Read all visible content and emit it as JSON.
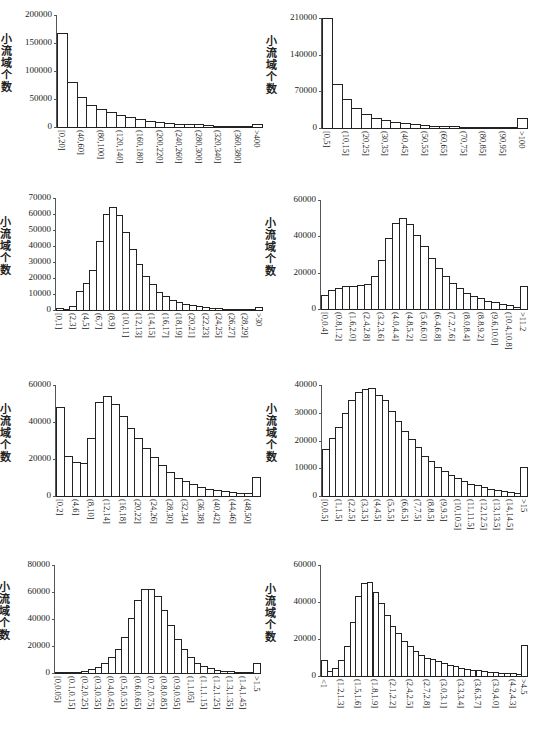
{
  "chart_data": [
    {
      "id": "c1",
      "type": "bar",
      "title": "",
      "xlabel": "小流域溪沟平均比降/‰",
      "ylabel": "小流域个数",
      "ylim": [
        0,
        200000
      ],
      "yticks": [
        0,
        50000,
        100000,
        150000,
        200000
      ],
      "categories": [
        "[0,20]",
        "(20,40]",
        "(40,60]",
        "(60,80]",
        "(80,100]",
        "(100,120]",
        "(120,140]",
        "(140,160]",
        "(160,180]",
        "(180,200]",
        "(200,220]",
        "(220,240]",
        "(240,260]",
        "(260,280]",
        "(280,300]",
        "(300,320]",
        "(320,340]",
        "(340,360]",
        "(360,380]",
        "(380,400]",
        ">400"
      ],
      "shown_tick_labels": [
        "[0,20]",
        "(40,60]",
        "(80,100]",
        "(120,140]",
        "(160,180]",
        "(200,220]",
        "(240,260]",
        "(280,300]",
        "(320,340]",
        "(360,380]",
        ">400"
      ],
      "values": [
        167000,
        80000,
        54000,
        39000,
        32000,
        26000,
        21000,
        17500,
        14000,
        11500,
        9500,
        7500,
        6000,
        5000,
        4500,
        3000,
        2500,
        1500,
        1000,
        800,
        5000
      ],
      "layout": {
        "left": 57,
        "right": 262,
        "top": 15,
        "base": 127
      }
    },
    {
      "id": "c2",
      "type": "bar",
      "title": "",
      "xlabel": "小流域河段比降/‰",
      "ylabel": "小流域个数",
      "ylim": [
        0,
        210000
      ],
      "yticks": [
        0,
        70000,
        140000,
        210000
      ],
      "categories": [
        "[0,5]",
        "(5,10]",
        "(10,15]",
        "(15,20]",
        "(20,25]",
        "(25,30]",
        "(30,35]",
        "(35,40]",
        "(40,45]",
        "(45,50]",
        "(50,55]",
        "(55,60]",
        "(60,65]",
        "(65,70]",
        "(70,75]",
        "(75,80]",
        "(80,85]",
        "(85,90]",
        "(90,95]",
        "(95,100]",
        ">100"
      ],
      "shown_tick_labels": [
        "[0,5]",
        "(10,15]",
        "(20,25]",
        "(30,35]",
        "(40,45]",
        "(50,55]",
        "(60,65]",
        "(70,75]",
        "(80,85]",
        "(90,95]",
        ">100"
      ],
      "values": [
        210000,
        84000,
        56000,
        38000,
        26000,
        19000,
        15000,
        11000,
        9000,
        7000,
        5500,
        4500,
        4000,
        3000,
        2500,
        2000,
        1500,
        1200,
        1000,
        1000,
        19000
      ],
      "layout": {
        "left": 322,
        "right": 527,
        "top": 18,
        "base": 128
      }
    },
    {
      "id": "c3",
      "type": "bar",
      "title": "",
      "xlabel": "小流域最长汇流路径长度/km",
      "ylabel": "小流域个数",
      "ylim": [
        0,
        70000
      ],
      "yticks": [
        0,
        10000,
        20000,
        30000,
        40000,
        50000,
        60000,
        70000
      ],
      "categories": [
        "[0,1]",
        "(1,2]",
        "(2,3]",
        "(3,4]",
        "(4,5]",
        "(5,6]",
        "(6,7]",
        "(7,8]",
        "(8,9]",
        "(9,10]",
        "(10,11]",
        "(11,12]",
        "(12,13]",
        "(13,14]",
        "(14,15]",
        "(15,16]",
        "(16,17]",
        "(17,18]",
        "(18,19]",
        "(19,20]",
        "(20,21]",
        "(21,22]",
        "(22,23]",
        "(23,24]",
        "(24,25]",
        "(25,26]",
        "(26,27]",
        "(27,28]",
        "(28,29]",
        "(29,30]",
        ">30"
      ],
      "shown_tick_labels": [
        "[0,1]",
        "(2,3]",
        "(4,5]",
        "(6,7]",
        "(8,9]",
        "(10,11]",
        "(12,13]",
        "(14,15]",
        "(16,17]",
        "(18,19]",
        "(20,21]",
        "(22,23]",
        "(24,25]",
        "(26,27]",
        "(28,29]",
        ">30"
      ],
      "values": [
        1500,
        500,
        2500,
        12000,
        17000,
        25000,
        43000,
        60000,
        64500,
        59500,
        49000,
        38000,
        28500,
        21000,
        16000,
        11500,
        8500,
        6500,
        5000,
        4000,
        3000,
        2200,
        1700,
        1300,
        1000,
        800,
        600,
        500,
        400,
        300,
        2000
      ],
      "layout": {
        "left": 56,
        "right": 262,
        "top": 198,
        "base": 310
      }
    },
    {
      "id": "c4",
      "type": "bar",
      "title": "",
      "xlabel": "小流域平均汇流路径长度/km",
      "ylabel": "小流域个数",
      "ylim": [
        0,
        60000
      ],
      "yticks": [
        0,
        20000,
        40000,
        60000
      ],
      "categories": [
        "[0,0.4]",
        "(0.4,0.8]",
        "(0.8,1.2]",
        "(1.2,1.6]",
        "(1.6,2.0]",
        "(2.0,2.4]",
        "(2.4,2.8]",
        "(2.8,3.2]",
        "(3.2,3.6]",
        "(3.6,4.0]",
        "(4.0,4.4]",
        "(4.4,4.8]",
        "(4.8,5.2]",
        "(5.2,5.6]",
        "(5.6,6.0]",
        "(6.0,6.4]",
        "(6.4,6.8]",
        "(6.8,7.2]",
        "(7.2,7.6]",
        "(7.6,8.0]",
        "(8.0,8.4]",
        "(8.4,8.8]",
        "(8.8,9.2]",
        "(9.2,9.6]",
        "(9.6,10.0]",
        "(10.0,10.4]",
        "(10.4,10.8]",
        "(10.8,11.2]",
        ">11.2"
      ],
      "shown_tick_labels": [
        "[0,0.4]",
        "(0.8,1.2]",
        "(1.6,2.0]",
        "(2.4,2.8]",
        "(3.2,3.6]",
        "(4.0,4.4]",
        "(4.8,5.2]",
        "(5.6,6.0]",
        "(6.4,6.8]",
        "(7.2,7.6]",
        "(8.0,8.4]",
        "(8.8,9.2]",
        "(9.6,10.0]",
        "(10.4,10.8]",
        ">11.2"
      ],
      "values": [
        7500,
        10500,
        11500,
        12500,
        12800,
        13200,
        14000,
        18000,
        27000,
        39000,
        47500,
        50000,
        47000,
        41000,
        34500,
        28000,
        22500,
        18000,
        14200,
        11500,
        9000,
        7300,
        5800,
        4600,
        3700,
        3000,
        2000,
        1000,
        12800
      ],
      "layout": {
        "left": 321,
        "right": 527,
        "top": 200,
        "base": 309
      }
    },
    {
      "id": "c5",
      "type": "bar",
      "title": "",
      "xlabel": "小流域溪沟总长度/km",
      "ylabel": "小流域个数",
      "ylim": [
        0,
        60000
      ],
      "yticks": [
        0,
        20000,
        40000,
        60000
      ],
      "categories": [
        "[0,2]",
        "(2,4]",
        "(4,6]",
        "(6,8]",
        "(8,10]",
        "(10,12]",
        "(12,14]",
        "(14,16]",
        "(16,18]",
        "(18,20]",
        "(20,22]",
        "(22,24]",
        "(24,26]",
        "(26,28]",
        "(28,30]",
        "(30,32]",
        "(32,34]",
        "(34,36]",
        "(36,38]",
        "(38,40]",
        "(40,42]",
        "(42,44]",
        "(44,46]",
        "(46,48]",
        "(48,50]",
        ">50"
      ],
      "shown_tick_labels": [
        "[0,2]",
        "(4,6]",
        "(8,10]",
        "(12,14]",
        "(16,18]",
        "(20,22]",
        "(24,26]",
        "(28,30]",
        "(32,34]",
        "(36,38]",
        "(40,42]",
        "(44,46]",
        "(48,50]"
      ],
      "values": [
        48000,
        21500,
        18500,
        18000,
        31500,
        51000,
        54000,
        49500,
        43000,
        37000,
        31500,
        26000,
        21000,
        16500,
        13000,
        10000,
        8000,
        6500,
        5000,
        4000,
        3200,
        2500,
        2000,
        1700,
        1500,
        10500
      ],
      "layout": {
        "left": 56,
        "right": 260,
        "top": 385,
        "base": 496
      }
    },
    {
      "id": "c6",
      "type": "bar",
      "title": "",
      "xlabel": "小流域河段长度/km",
      "ylabel": "小流域个数",
      "ylim": [
        0,
        40000
      ],
      "yticks": [
        0,
        10000,
        20000,
        30000,
        40000
      ],
      "categories": [
        "[0,0.5]",
        "(0.5,1]",
        "(1,1.5]",
        "(1.5,2]",
        "(2,2.5]",
        "(2.5,3]",
        "(3,3.5]",
        "(3.5,4]",
        "(4,4.5]",
        "(4.5,5]",
        "(5,5.5]",
        "(5.5,6]",
        "(6,6.5]",
        "(6.5,7]",
        "(7,7.5]",
        "(7.5,8]",
        "(8,8.5]",
        "(8.5,9]",
        "(9,9.5]",
        "(9.5,10]",
        "(10,10.5]",
        "(10.5,11]",
        "(11,11.5]",
        "(11.5,12]",
        "(12,12.5]",
        "(12.5,13]",
        "(13,13.5]",
        "(13.5,14]",
        "(14,14.5]",
        "(14.5,15]",
        ">15"
      ],
      "shown_tick_labels": [
        "[0,0.5]",
        "(1,1.5]",
        "(2,2.5]",
        "(3,3.5]",
        "(4,4.5]",
        "(5,5.5]",
        "(6,6.5]",
        "(7,7.5]",
        "(8,8.5]",
        "(9,9.5]",
        "(10,10.5]",
        "(11,11.5]",
        "(12,12.5]",
        "(13,13.5]",
        "(14,14.5]",
        ">15"
      ],
      "values": [
        17000,
        21000,
        25000,
        30000,
        34500,
        37500,
        38500,
        39000,
        36500,
        34500,
        30500,
        27000,
        23500,
        20500,
        17500,
        14500,
        12500,
        10500,
        9000,
        7500,
        6500,
        5500,
        4500,
        4000,
        3200,
        2700,
        2200,
        1800,
        1400,
        1000,
        10500
      ],
      "layout": {
        "left": 322,
        "right": 527,
        "top": 385,
        "base": 496
      }
    },
    {
      "id": "c7",
      "type": "bar",
      "title": "",
      "xlabel": "小流域平均坡长/km",
      "ylabel": "小流域个数",
      "ylim": [
        0,
        80000
      ],
      "yticks": [
        0,
        20000,
        40000,
        60000,
        80000
      ],
      "categories": [
        "[0,0.05]",
        "(0.05,0.1]",
        "(0.1,0.15]",
        "(0.15,0.2]",
        "(0.2,0.25]",
        "(0.25,0.3]",
        "(0.3,0.35]",
        "(0.35,0.4]",
        "(0.4,0.45]",
        "(0.45,0.5]",
        "(0.5,0.55]",
        "(0.55,0.6]",
        "(0.6,0.65]",
        "(0.65,0.7]",
        "(0.7,0.75]",
        "(0.75,0.8]",
        "(0.8,0.85]",
        "(0.85,0.9]",
        "(0.9,0.95]",
        "(0.95,1]",
        "(1,1.05]",
        "(1.05,1.1]",
        "(1.1,1.15]",
        "(1.15,1.2]",
        "(1.2,1.25]",
        "(1.25,1.3]",
        "(1.3,1.35]",
        "(1.35,1.4]",
        "(1.4,1.45]",
        "(1.45,1.5]",
        ">1.5"
      ],
      "shown_tick_labels": [
        "[0,0.05]",
        "(0.1,0.15]",
        "(0.2,0.25]",
        "(0.3,0.35]",
        "(0.4,0.45]",
        "(0.5,0.55]",
        "(0.6,0.65]",
        "(0.7,0.75]",
        "(0.8,0.85]",
        "(0.9,0.95]",
        "(1,1.05]",
        "(1.1,1.15]",
        "(1.2,1.25]",
        "(1.3,1.35]",
        "(1.4,1.45]",
        ">1.5"
      ],
      "values": [
        200,
        300,
        500,
        800,
        1500,
        3000,
        4500,
        7500,
        11500,
        17500,
        27000,
        40500,
        54000,
        62000,
        62500,
        57000,
        47000,
        35500,
        25500,
        17500,
        11500,
        7500,
        5000,
        3500,
        2500,
        1800,
        1200,
        800,
        600,
        400,
        7500
      ],
      "layout": {
        "left": 55,
        "right": 260,
        "top": 565,
        "base": 673
      }
    },
    {
      "id": "c8",
      "type": "bar",
      "title": "",
      "xlabel": "小流域最大坡长/km",
      "ylabel": "小流域个数",
      "ylim": [
        0,
        60000
      ],
      "yticks": [
        0,
        20000,
        40000,
        60000
      ],
      "categories": [
        "<1",
        "(1,1.1]",
        "(1.1,1.2]",
        "(1.2,1.3]",
        "(1.3,1.4]",
        "(1.4,1.5]",
        "(1.5,1.6]",
        "(1.6,1.7]",
        "(1.7,1.8]",
        "(1.8,1.9]",
        "(1.9,2.0]",
        "(2.0,2.1]",
        "(2.1,2.2]",
        "(2.2,2.3]",
        "(2.3,2.4]",
        "(2.4,2.5]",
        "(2.5,2.6]",
        "(2.6,2.7]",
        "(2.7,2.8]",
        "(2.8,2.9]",
        "(2.9,3.0]",
        "(3.0,3.1]",
        "(3.1,3.2]",
        "(3.2,3.3]",
        "(3.3,3.4]",
        "(3.4,3.5]",
        "(3.5,3.6]",
        "(3.6,3.7]",
        "(3.7,3.8]",
        "(3.8,3.9]",
        "(3.9,4.0]",
        "(4.0,4.1]",
        "(4.1,4.2]",
        "(4.2,4.3]",
        "(4.3,4.5]",
        ">4.5"
      ],
      "shown_tick_labels": [
        "<1",
        "(1.2,1.3]",
        "(1.5,1.6]",
        "(1.8,1.9]",
        "(2.1,2.2]",
        "(2.4,2.5]",
        "(2.7,2.8]",
        "(3.0,3.1]",
        "(3.3,3.4]",
        "(3.6,3.7]",
        "(3.9,4.0]",
        "(4.2,4.3]",
        ">4.5"
      ],
      "values": [
        8500,
        2500,
        4500,
        8500,
        16000,
        29000,
        43000,
        50500,
        51000,
        45500,
        39500,
        33000,
        27000,
        23000,
        19000,
        16000,
        13500,
        11500,
        10000,
        9000,
        8000,
        7000,
        6000,
        5200,
        4500,
        4000,
        3500,
        3000,
        2700,
        2400,
        2200,
        1800,
        1600,
        1400,
        1200,
        16500
      ],
      "layout": {
        "left": 321,
        "right": 527,
        "top": 565,
        "base": 676
      }
    }
  ]
}
